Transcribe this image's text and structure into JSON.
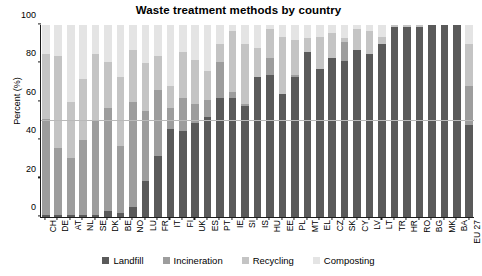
{
  "chart_data": {
    "type": "bar",
    "subtype": "stacked-bar-100-percent",
    "title": "Waste treatment methods by country",
    "xlabel": "",
    "ylabel": "Percent (%)",
    "ylim": [
      0,
      100
    ],
    "yticks": [
      0,
      20,
      40,
      60,
      80,
      100
    ],
    "gridlines": [
      50
    ],
    "grid": "single horizontal gridline at 50",
    "legend_position": "bottom",
    "categories": [
      "CH",
      "DE",
      "AT",
      "NL",
      "SE",
      "DK",
      "BE",
      "NO",
      "LU",
      "FR",
      "IT",
      "FI",
      "UK",
      "ES",
      "PT",
      "IE",
      "SI",
      "IS",
      "HU",
      "EE",
      "PL",
      "MT",
      "EL",
      "CZ",
      "SK",
      "CY",
      "LV",
      "LT",
      "TR",
      "HR",
      "RO",
      "BG",
      "MK",
      "BA",
      "EU 27"
    ],
    "series": [
      {
        "name": "Landfill",
        "color": "#5a5a5a",
        "values": [
          1,
          1,
          1,
          1,
          1,
          3,
          2,
          5,
          19,
          32,
          46,
          45,
          49,
          52,
          62,
          62,
          58,
          73,
          74,
          64,
          73,
          86,
          77,
          83,
          81,
          87,
          85,
          90,
          99,
          99,
          99,
          100,
          100,
          100,
          48
        ]
      },
      {
        "name": "Incineration",
        "color": "#9d9d9d",
        "values": [
          50,
          35,
          30,
          39,
          49,
          54,
          35,
          55,
          36,
          34,
          11,
          17,
          10,
          9,
          19,
          3,
          1,
          0,
          9,
          0,
          1,
          0,
          0,
          0,
          10,
          0,
          0,
          0,
          0,
          0,
          0,
          0,
          0,
          0,
          20
        ]
      },
      {
        "name": "Recycling",
        "color": "#c4c4c4",
        "values": [
          34,
          48,
          29,
          32,
          35,
          24,
          36,
          27,
          25,
          18,
          11,
          24,
          23,
          15,
          9,
          32,
          31,
          15,
          15,
          30,
          18,
          7,
          17,
          13,
          2,
          11,
          12,
          4,
          1,
          1,
          1,
          0,
          0,
          0,
          22
        ]
      },
      {
        "name": "Composting",
        "color": "#e4e4e4",
        "values": [
          15,
          16,
          40,
          28,
          15,
          19,
          27,
          13,
          20,
          16,
          32,
          14,
          18,
          24,
          10,
          3,
          10,
          12,
          2,
          6,
          8,
          7,
          6,
          4,
          7,
          2,
          3,
          6,
          0,
          0,
          0,
          0,
          0,
          0,
          10
        ]
      }
    ]
  },
  "legend": {
    "items": [
      {
        "label": "Landfill",
        "color": "#5a5a5a"
      },
      {
        "label": "Incineration",
        "color": "#9d9d9d"
      },
      {
        "label": "Recycling",
        "color": "#c4c4c4"
      },
      {
        "label": "Composting",
        "color": "#e4e4e4"
      }
    ]
  }
}
